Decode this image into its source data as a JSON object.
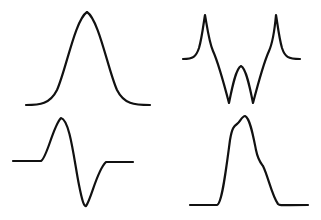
{
  "figure": {
    "background": "#ffffff",
    "stroke_color": "#111111",
    "panels": [
      {
        "id": "top-left",
        "shape": "gaussian-bell",
        "path": "M26,105 C40,105 50,104 57,90 C66,70 75,20 87,12 C99,20 108,70 117,90 C124,104 134,105 150,105"
      },
      {
        "id": "top-right",
        "shape": "double-peak-with-twin-dips",
        "path": "M183,59 C193,59 196,57 199,48 C202,38 204,20 205,15 C207,26 209,42 213,51 C218,62 223,80 229,103 C232,88 236,68 241,66 C246,68 250,88 253,103 C259,80 264,62 269,51 C273,42 275,26 276,15 C277,20 279,38 282,48 C285,57 288,59 300,59"
      },
      {
        "id": "bottom-left",
        "shape": "gaussian-derivative",
        "path": "M13,161 L41,161 C47,158 53,126 61,118 C70,120 74,160 79,185 C82,200 84,207 86,206 C91,200 97,170 106,162 L133,162"
      },
      {
        "id": "bottom-right",
        "shape": "skewed-peak-with-shoulders",
        "path": "M190,205 L217,205 C222,204 226,170 230,140 C232,128 234,126 237,124 C240,122 242,116 245,116 C250,118 253,135 256,150 C258,160 260,162 263,166 C268,176 272,196 278,204 C280,206 283,205 308,205"
      }
    ]
  }
}
